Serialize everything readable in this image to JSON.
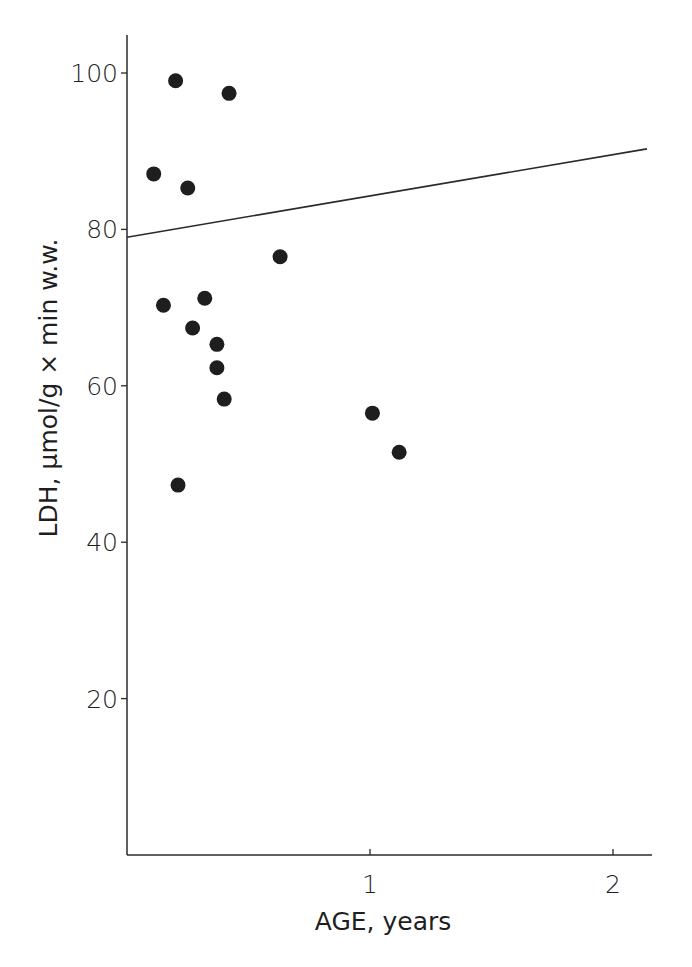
{
  "chart_data": {
    "type": "scatter",
    "title": "",
    "xlabel": "AGE, years",
    "ylabel": "LDH, μmol/g × min w.w.",
    "xlim": [
      0,
      2.15
    ],
    "ylim": [
      0,
      105
    ],
    "x_ticks": [
      1,
      2
    ],
    "x_tick_labels": [
      "1",
      "2"
    ],
    "y_ticks": [
      20,
      40,
      60,
      80,
      100
    ],
    "y_tick_labels": [
      "20",
      "40",
      "60",
      "80",
      "100"
    ],
    "grid": false,
    "legend": null,
    "series": [
      {
        "name": "LDH activity",
        "marker": "filled-circle",
        "color": "#1e1e1e",
        "points": [
          {
            "x": 0.2,
            "y": 99.0
          },
          {
            "x": 0.42,
            "y": 97.4
          },
          {
            "x": 0.11,
            "y": 87.1
          },
          {
            "x": 0.25,
            "y": 85.3
          },
          {
            "x": 0.63,
            "y": 76.5
          },
          {
            "x": 0.15,
            "y": 70.3
          },
          {
            "x": 0.32,
            "y": 71.2
          },
          {
            "x": 0.27,
            "y": 67.4
          },
          {
            "x": 0.37,
            "y": 65.3
          },
          {
            "x": 0.37,
            "y": 62.3
          },
          {
            "x": 0.4,
            "y": 58.3
          },
          {
            "x": 0.21,
            "y": 47.3
          },
          {
            "x": 1.01,
            "y": 56.5
          },
          {
            "x": 1.12,
            "y": 51.5
          }
        ]
      }
    ],
    "fit_line": {
      "name": "regression line",
      "color": "#2a2a2a",
      "start": {
        "x": 0.0,
        "y": 79.0
      },
      "end": {
        "x": 2.14,
        "y": 90.3
      }
    }
  }
}
